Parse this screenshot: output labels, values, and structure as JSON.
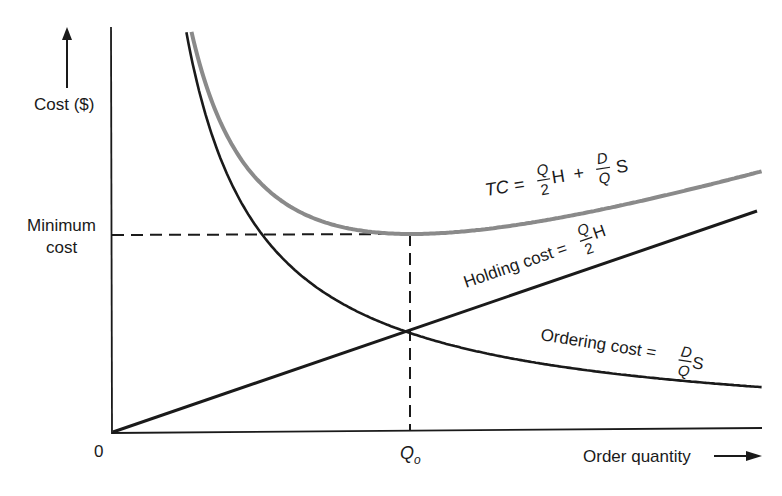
{
  "chart_data": {
    "type": "line",
    "title": "",
    "xlabel": "Order quantity",
    "ylabel": "Cost ($)",
    "x_ticks": [
      {
        "label": "0",
        "q": 0
      },
      {
        "label": "Q",
        "subscript": "o",
        "q": 1
      }
    ],
    "y_ticks": [
      {
        "label_line1": "Minimum",
        "label_line2": "cost",
        "value": 2
      }
    ],
    "grid": false,
    "legend": "none",
    "axis_units": "relative (Q normalized so Qo = 1; cost normalized so cost at Qo for each component = 1)",
    "xlim": [
      0,
      2.18
    ],
    "ylim": [
      0,
      4.0
    ],
    "series": [
      {
        "name": "Holding cost",
        "formula": "Holding cost = (Q/2)H",
        "color": "#1a1a1a",
        "x": [
          0,
          0.5,
          1,
          1.5,
          2,
          2.164
        ],
        "values": [
          0,
          0.5,
          1,
          1.5,
          2,
          2.16
        ]
      },
      {
        "name": "Ordering cost",
        "formula": "Ordering cost = (D/Q)S",
        "color": "#1a1a1a",
        "x": [
          0.04,
          0.1,
          0.25,
          0.5,
          1,
          1.5,
          2,
          2.18
        ],
        "values": [
          25,
          10,
          4,
          2,
          1,
          0.67,
          0.5,
          0.46
        ]
      },
      {
        "name": "Total cost",
        "formula": "TC = (Q/2)H + (D/Q)S",
        "color": "#8a8a8a",
        "x": [
          0.08,
          0.25,
          0.5,
          0.75,
          1,
          1.5,
          2,
          2.164
        ],
        "values": [
          12.58,
          4.25,
          2.5,
          2.08,
          2,
          2.17,
          2.5,
          2.62
        ]
      }
    ],
    "annotations": [
      {
        "text": "Minimum cost",
        "type": "dashed-horizontal",
        "y": 2,
        "x_range": [
          0,
          1
        ]
      },
      {
        "text": "Qo",
        "type": "dashed-vertical",
        "x": 1,
        "y_range": [
          0,
          2
        ]
      },
      {
        "text": "Holding and ordering costs intersect at Qo",
        "point": [
          1,
          1
        ]
      }
    ]
  },
  "labels": {
    "y_axis": "Cost ($)",
    "x_axis": "Order quantity",
    "origin": "0",
    "min_cost_line1": "Minimum",
    "min_cost_line2": "cost",
    "q_opt": "Q",
    "q_opt_sub": "o",
    "tc_lhs": "TC =",
    "tc_plus": "+",
    "holding_lhs": "Holding cost =",
    "ordering_lhs": "Ordering cost =",
    "frac_Q": "Q",
    "frac_2": "2",
    "frac_D": "D",
    "var_H": "H",
    "var_S": "S"
  },
  "colors": {
    "ink": "#1a1a1a",
    "tc_curve": "#8a8a8a",
    "background": "#ffffff"
  }
}
